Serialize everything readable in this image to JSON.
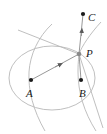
{
  "figure": {
    "background_color": "#ffffff",
    "width": 107,
    "height": 134,
    "curve_color": "#b0b0b0",
    "line_color": "#8c8c8c",
    "point_color": "#1a1a1a",
    "label_color": "#1a1a1a"
  },
  "points": [
    {
      "id": "A",
      "label": "A",
      "x": 31,
      "y": 80,
      "marker": "dot",
      "label_dx": -5,
      "label_dy": 8
    },
    {
      "id": "B",
      "label": "B",
      "x": 81,
      "y": 80,
      "marker": "dot",
      "label_dx": -2,
      "label_dy": 8
    },
    {
      "id": "C",
      "label": "C",
      "x": 83,
      "y": 14,
      "marker": "dot",
      "label_dx": 5,
      "label_dy": -2
    },
    {
      "id": "P",
      "label": "P",
      "x": 79,
      "y": 54,
      "marker": "dot",
      "label_dx": 7,
      "label_dy": -6
    }
  ],
  "curves": [
    {
      "id": "ellipse",
      "type": "ellipse",
      "cx": 52,
      "cy": 78,
      "rx": 43,
      "ry": 32,
      "stroke": "#b8b8b8"
    },
    {
      "id": "hyperbola-left-branch",
      "type": "hyperbola-branch",
      "stroke": "#b8b8b8"
    },
    {
      "id": "hyperbola-right-branch",
      "type": "hyperbola-branch",
      "stroke": "#b8b8b8"
    }
  ],
  "segments": [
    {
      "id": "segment-AP",
      "from": "A",
      "to": "P",
      "arrow": true,
      "arrow_position": 0.55,
      "stroke": "#8c8c8c"
    },
    {
      "id": "segment-PC",
      "from": "P",
      "to": "C",
      "arrow": true,
      "arrow_position": 0.55,
      "stroke": "#8c8c8c"
    },
    {
      "id": "segment-PB",
      "from": "P",
      "to": "B",
      "arrow": false,
      "stroke": "#8c8c8c"
    }
  ],
  "labels": {
    "A": "A",
    "B": "B",
    "C": "C",
    "P": "P"
  }
}
